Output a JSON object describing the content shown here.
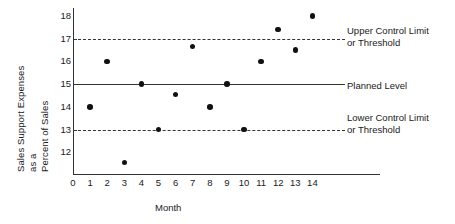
{
  "chart_data": {
    "type": "scatter",
    "title": "",
    "xlabel": "Month",
    "ylabel_lines": [
      "Sales Support Expenses",
      "as a",
      "Percent of Sales"
    ],
    "ylabel": "Sales Support Expenses as a Percent of Sales",
    "x": [
      1,
      2,
      3,
      4,
      5,
      6,
      7,
      8,
      9,
      10,
      11,
      12,
      13,
      14
    ],
    "values": [
      14.0,
      16.0,
      11.55,
      15.0,
      13.0,
      14.55,
      16.65,
      14.0,
      15.0,
      13.0,
      16.0,
      17.4,
      16.5,
      18.0
    ],
    "xtick_labels": [
      "0",
      "1",
      "2",
      "3",
      "4",
      "5",
      "6",
      "7",
      "8",
      "9",
      "10",
      "11",
      "12",
      "13",
      "14"
    ],
    "xticks": [
      0,
      1,
      2,
      3,
      4,
      5,
      6,
      7,
      8,
      9,
      10,
      11,
      12,
      13,
      14
    ],
    "ytick_labels": [
      "12",
      "13",
      "14",
      "15",
      "16",
      "17",
      "18"
    ],
    "yticks": [
      12,
      13,
      14,
      15,
      16,
      17,
      18
    ],
    "xlim": [
      0,
      18
    ],
    "ylim": [
      11.0,
      18.35
    ],
    "grid": false,
    "legend_position": "right-inline-annotations",
    "reference_lines": [
      {
        "name": "upper-control-limit",
        "value": 17,
        "style": "dashed",
        "label_lines": [
          "Upper Control Limit",
          "or Threshold"
        ]
      },
      {
        "name": "planned-level",
        "value": 15,
        "style": "solid",
        "label_lines": [
          "Planned Level"
        ]
      },
      {
        "name": "lower-control-limit",
        "value": 13,
        "style": "dashed",
        "label_lines": [
          "Lower Control Limit",
          "or Threshold"
        ]
      }
    ],
    "annotations": [
      "Upper Control Limit or Threshold",
      "Planned Level",
      "Lower Control Limit or Threshold"
    ]
  },
  "colors": {
    "axis": "#333333",
    "marker": "#111111",
    "background": "#ffffff",
    "text": "#1a1a1a"
  }
}
